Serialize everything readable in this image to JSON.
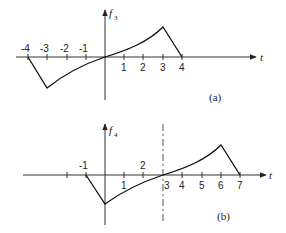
{
  "figure": {
    "panels": [
      {
        "id": "a",
        "caption": "(a)",
        "y_label": "f",
        "y_label_sub": "3",
        "x_label": "t",
        "tick_labels": [
          "-4",
          "-3",
          "-2",
          "-1",
          "1",
          "2",
          "3",
          "4"
        ],
        "tick_values": [
          -4,
          -3,
          -2,
          -1,
          1,
          2,
          3,
          4
        ],
        "points": [
          [
            -4,
            0
          ],
          [
            -3,
            -1
          ],
          [
            0,
            0
          ],
          [
            3,
            1
          ],
          [
            4,
            0
          ]
        ],
        "description": "Odd-symmetric waveform: linear drop from (-4,0) to (-3,-1), concave curve rising through origin to (3,1), linear drop to (4,0)"
      },
      {
        "id": "b",
        "caption": "(b)",
        "y_label": "f",
        "y_label_sub": "4",
        "x_label": "t",
        "tick_labels": [
          "-1",
          "1",
          "2",
          "3",
          "4",
          "5",
          "6",
          "7"
        ],
        "tick_values": [
          -1,
          1,
          2,
          3,
          4,
          5,
          6,
          7
        ],
        "extra_ticks": [
          -2
        ],
        "dashed_line_at": 3,
        "points": [
          [
            -1,
            0
          ],
          [
            0,
            -1
          ],
          [
            3,
            0
          ],
          [
            6,
            1
          ],
          [
            7,
            0
          ]
        ],
        "description": "Panel (a) shifted right by 3: linear drop from (-1,0) to (0,-1), curve rising through (3,0) to (6,1), linear drop to (7,0); dashed vertical line at t=3"
      }
    ]
  }
}
